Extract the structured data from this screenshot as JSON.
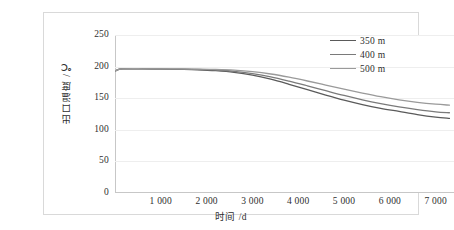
{
  "chart_data": {
    "type": "line",
    "title": "",
    "xlabel": "时间 /d",
    "ylabel": "出口温度 /℃",
    "xlim": [
      0,
      7400
    ],
    "ylim": [
      0,
      250
    ],
    "grid": true,
    "legend_position": "top-right",
    "xticks": [
      "1 000",
      "2 000",
      "3 000",
      "4 000",
      "5 000",
      "6 000",
      "7 000"
    ],
    "xtick_values": [
      1000,
      2000,
      3000,
      4000,
      5000,
      6000,
      7000
    ],
    "yticks": [
      "0",
      "50",
      "100",
      "150",
      "200",
      "250"
    ],
    "ytick_values": [
      0,
      50,
      100,
      150,
      200,
      250
    ],
    "x": [
      0,
      100,
      200,
      400,
      600,
      800,
      1000,
      1400,
      1800,
      2200,
      2600,
      3000,
      3400,
      3800,
      4200,
      4600,
      5000,
      5400,
      5800,
      6200,
      6600,
      7000,
      7300
    ],
    "series": [
      {
        "name": "350 m",
        "color": "#5a5a5a",
        "values": [
          193,
          196,
          196.5,
          196.5,
          196.3,
          196.1,
          196,
          195.6,
          195,
          193.6,
          191,
          186.5,
          180,
          172,
          163.5,
          155,
          147,
          140,
          134,
          129,
          124,
          120,
          118
        ]
      },
      {
        "name": "400 m",
        "color": "#7a7a7a",
        "values": [
          193,
          196,
          196.5,
          196.5,
          196.4,
          196.3,
          196.2,
          196,
          195.6,
          194.6,
          192.6,
          189,
          183.8,
          177,
          169.5,
          161.8,
          154.3,
          147.5,
          141.5,
          136.3,
          132,
          128.5,
          127
        ]
      },
      {
        "name": "500 m",
        "color": "#9a9a9a",
        "values": [
          193,
          196,
          196.5,
          196.6,
          196.5,
          196.4,
          196.4,
          196.3,
          196.1,
          195.6,
          194.4,
          192,
          188.3,
          183.2,
          177.2,
          170.8,
          164.3,
          158.2,
          152.5,
          147.5,
          143.5,
          140.5,
          139
        ]
      }
    ]
  }
}
